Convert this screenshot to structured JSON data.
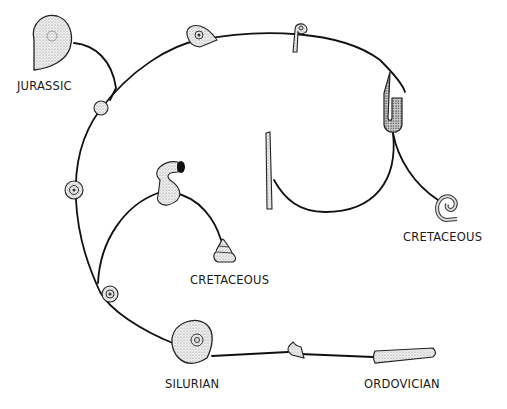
{
  "diagram": {
    "type": "evolutionary-tree",
    "labels": {
      "jurassic": "JURASSIC",
      "cretaceous_right": "CRETACEOUS",
      "cretaceous_inner": "CRETACEOUS",
      "silurian": "SILURIAN",
      "ordovician": "ORDOVICIAN"
    },
    "nodes": [
      {
        "id": "ordovician-straight-cone",
        "label": "ORDOVICIAN"
      },
      {
        "id": "curved-shell"
      },
      {
        "id": "silurian-coiled-shell",
        "label": "SILURIAN"
      },
      {
        "id": "small-coiled-shell-lower"
      },
      {
        "id": "small-coiled-shell-mid"
      },
      {
        "id": "small-coiled-shell-upper"
      },
      {
        "id": "jurassic-coiled-shell",
        "label": "JURASSIC"
      },
      {
        "id": "top-coiled-shell"
      },
      {
        "id": "hook-shell-top"
      },
      {
        "id": "hairpin-shell"
      },
      {
        "id": "straight-tapered-shell"
      },
      {
        "id": "cretaceous-uncoiled-spiral",
        "label": "CRETACEOUS"
      },
      {
        "id": "s-shaped-shell"
      },
      {
        "id": "turreted-helical-shell",
        "label": "CRETACEOUS"
      }
    ],
    "colors": {
      "line": "#111111",
      "fill": "#e6e6e6",
      "background": "#ffffff"
    }
  }
}
